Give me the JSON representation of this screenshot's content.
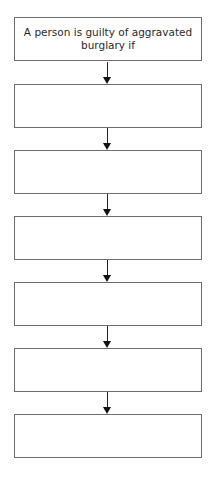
{
  "diagram": {
    "type": "flowchart",
    "direction": "top-to-bottom",
    "boxes": [
      {
        "label": "A person is guilty of aggravated burglary if"
      },
      {
        "label": ""
      },
      {
        "label": ""
      },
      {
        "label": ""
      },
      {
        "label": ""
      },
      {
        "label": ""
      },
      {
        "label": ""
      }
    ],
    "arrows": [
      {
        "from": 0,
        "to": 1
      },
      {
        "from": 1,
        "to": 2
      },
      {
        "from": 2,
        "to": 3
      },
      {
        "from": 3,
        "to": 4
      },
      {
        "from": 4,
        "to": 5
      },
      {
        "from": 5,
        "to": 6
      }
    ],
    "colors": {
      "border": "#6e6e6e",
      "arrow": "#222222",
      "text": "#2a2a2a",
      "background": "#ffffff"
    }
  }
}
